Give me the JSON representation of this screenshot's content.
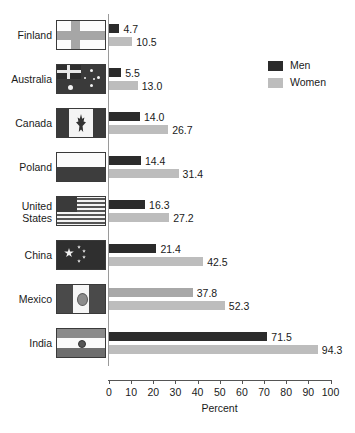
{
  "chart_data": {
    "type": "bar",
    "orientation": "horizontal",
    "title": "",
    "xlabel": "Percent",
    "ylabel": "",
    "xlim": [
      0,
      100
    ],
    "xticks": [
      0,
      10,
      20,
      30,
      40,
      50,
      60,
      70,
      80,
      90,
      100
    ],
    "grid": false,
    "legend_position": "top-right",
    "categories": [
      "Finland",
      "Australia",
      "Canada",
      "Poland",
      "United States",
      "China",
      "Mexico",
      "India"
    ],
    "series": [
      {
        "name": "Men",
        "color": "#2b2b2b",
        "values": [
          4.7,
          5.5,
          14.0,
          14.4,
          16.3,
          21.4,
          37.8,
          71.5
        ]
      },
      {
        "name": "Women",
        "color": "#bdbdbd",
        "values": [
          10.5,
          13.0,
          26.7,
          31.4,
          27.2,
          42.5,
          52.3,
          94.3
        ]
      }
    ],
    "data_labels": {
      "Finland": {
        "men": "4.7",
        "women": "10.5"
      },
      "Australia": {
        "men": "5.5",
        "women": "13.0"
      },
      "Canada": {
        "men": "14.0",
        "women": "26.7"
      },
      "Poland": {
        "men": "14.4",
        "women": "31.4"
      },
      "United States": {
        "men": "16.3",
        "women": "27.2"
      },
      "China": {
        "men": "21.4",
        "women": "42.5"
      },
      "Mexico": {
        "men": "37.8",
        "women": "52.3"
      },
      "India": {
        "men": "71.5",
        "women": "94.3"
      }
    }
  },
  "axis": {
    "x_title": "Percent",
    "tick_labels": [
      "0",
      "10",
      "20",
      "30",
      "40",
      "50",
      "60",
      "70",
      "80",
      "90",
      "100"
    ]
  },
  "legend": {
    "items": [
      {
        "label": "Men",
        "swatch": "men-swatch"
      },
      {
        "label": "Women",
        "swatch": "women-swatch"
      }
    ]
  },
  "rows": [
    {
      "label": "Finland",
      "label_line2": "",
      "flag": "finland-flag",
      "men": "4.7",
      "women": "10.5",
      "men_value": 4.7,
      "women_value": 10.5
    },
    {
      "label": "Australia",
      "label_line2": "",
      "flag": "australia-flag",
      "men": "5.5",
      "women": "13.0",
      "men_value": 5.5,
      "women_value": 13.0
    },
    {
      "label": "Canada",
      "label_line2": "",
      "flag": "canada-flag",
      "men": "14.0",
      "women": "26.7",
      "men_value": 14.0,
      "women_value": 26.7
    },
    {
      "label": "Poland",
      "label_line2": "",
      "flag": "poland-flag",
      "men": "14.4",
      "women": "31.4",
      "men_value": 14.4,
      "women_value": 31.4
    },
    {
      "label": "United",
      "label_line2": "States",
      "flag": "united-states-flag",
      "men": "16.3",
      "women": "27.2",
      "men_value": 16.3,
      "women_value": 27.2
    },
    {
      "label": "China",
      "label_line2": "",
      "flag": "china-flag",
      "men": "21.4",
      "women": "42.5",
      "men_value": 21.4,
      "women_value": 42.5
    },
    {
      "label": "Mexico",
      "label_line2": "",
      "flag": "mexico-flag",
      "men": "37.8",
      "women": "52.3",
      "men_value": 37.8,
      "women_value": 52.3
    },
    {
      "label": "India",
      "label_line2": "",
      "flag": "india-flag",
      "men": "71.5",
      "women": "94.3",
      "men_value": 71.5,
      "women_value": 94.3
    }
  ]
}
